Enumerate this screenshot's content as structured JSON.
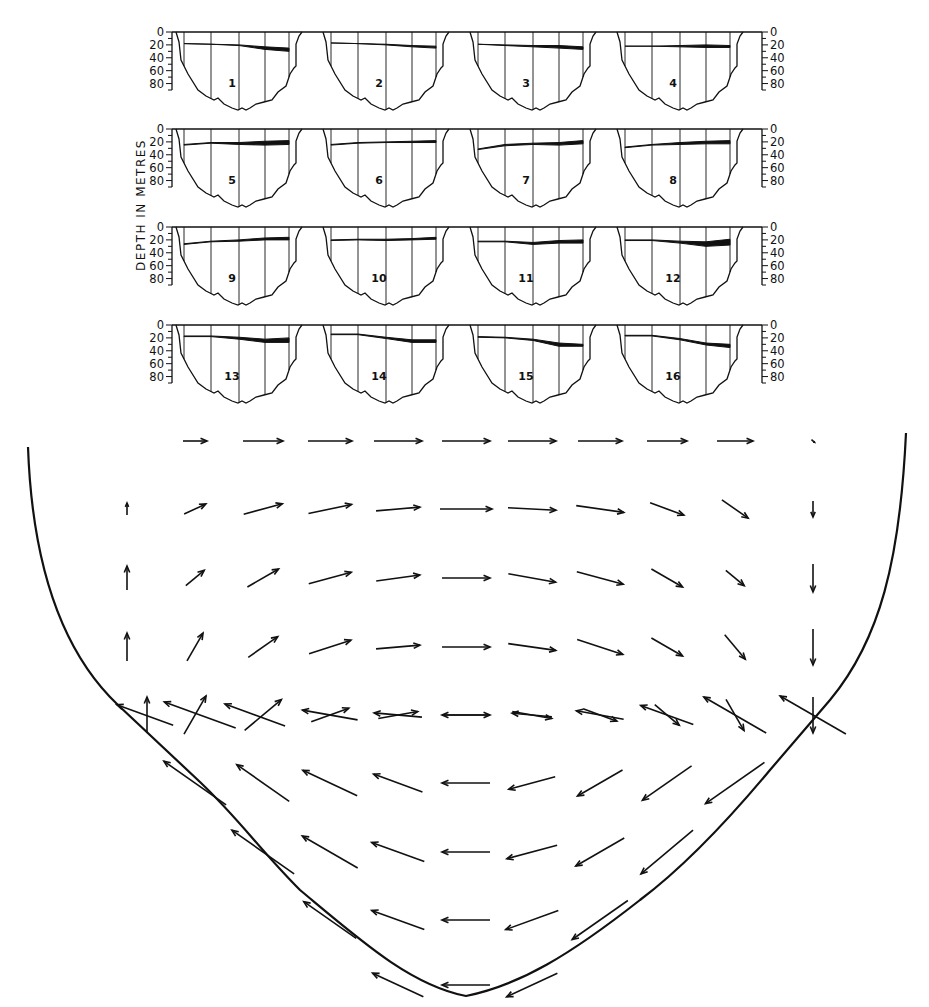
{
  "figure": {
    "upper": {
      "y_axis_label": "DEPTH IN METRES",
      "y_axis_label_words": [
        "DEPTH",
        "IN",
        "METRES"
      ],
      "depth_ticks": [
        "0",
        "20",
        "40",
        "60",
        "80"
      ],
      "panels": [
        {
          "id": "1",
          "thermocline_top": [
            18,
            19,
            20,
            23,
            25
          ],
          "thermocline_bottom": [
            18,
            19,
            21,
            27,
            30
          ]
        },
        {
          "id": "2",
          "thermocline_top": [
            17,
            18,
            19,
            21,
            22
          ],
          "thermocline_bottom": [
            17,
            18,
            20,
            23,
            25
          ]
        },
        {
          "id": "3",
          "thermocline_top": [
            19,
            20,
            21,
            21,
            23
          ],
          "thermocline_bottom": [
            19,
            21,
            23,
            25,
            27
          ]
        },
        {
          "id": "4",
          "thermocline_top": [
            22,
            22,
            21,
            20,
            21
          ],
          "thermocline_bottom": [
            22,
            22,
            23,
            24,
            24
          ]
        },
        {
          "id": "5",
          "thermocline_top": [
            24,
            21,
            21,
            19,
            18
          ],
          "thermocline_bottom": [
            25,
            22,
            24,
            25,
            24
          ]
        },
        {
          "id": "6",
          "thermocline_top": [
            24,
            21,
            20,
            19,
            18
          ],
          "thermocline_bottom": [
            25,
            22,
            21,
            21,
            21
          ]
        },
        {
          "id": "7",
          "thermocline_top": [
            31,
            24,
            22,
            21,
            18
          ],
          "thermocline_bottom": [
            32,
            26,
            24,
            25,
            23
          ]
        },
        {
          "id": "8",
          "thermocline_top": [
            28,
            24,
            21,
            19,
            18
          ],
          "thermocline_bottom": [
            29,
            25,
            24,
            23,
            23
          ]
        },
        {
          "id": "9",
          "thermocline_top": [
            26,
            22,
            20,
            17,
            16
          ],
          "thermocline_bottom": [
            27,
            23,
            22,
            20,
            20
          ]
        },
        {
          "id": "10",
          "thermocline_top": [
            20,
            19,
            19,
            18,
            16
          ],
          "thermocline_bottom": [
            21,
            20,
            21,
            20,
            19
          ]
        },
        {
          "id": "11",
          "thermocline_top": [
            22,
            22,
            24,
            21,
            20
          ],
          "thermocline_bottom": [
            23,
            23,
            27,
            25,
            25
          ]
        },
        {
          "id": "12",
          "thermocline_top": [
            20,
            20,
            22,
            23,
            19
          ],
          "thermocline_bottom": [
            21,
            21,
            25,
            30,
            28
          ]
        },
        {
          "id": "13",
          "thermocline_top": [
            17,
            17,
            19,
            22,
            20
          ],
          "thermocline_bottom": [
            18,
            18,
            22,
            27,
            27
          ]
        },
        {
          "id": "14",
          "thermocline_top": [
            14,
            14,
            19,
            23,
            23
          ],
          "thermocline_bottom": [
            15,
            15,
            21,
            27,
            27
          ]
        },
        {
          "id": "15",
          "thermocline_top": [
            18,
            19,
            22,
            28,
            30
          ],
          "thermocline_bottom": [
            19,
            20,
            24,
            33,
            33
          ]
        },
        {
          "id": "16",
          "thermocline_top": [
            16,
            16,
            21,
            28,
            30
          ],
          "thermocline_bottom": [
            17,
            17,
            23,
            31,
            35
          ]
        }
      ]
    },
    "lower": {
      "description": "Current vectors inside basin outline",
      "rows": [
        {
          "y": 441,
          "vectors": [
            [
              195,
              0.6,
              0
            ],
            [
              263,
              1.0,
              0
            ],
            [
              330,
              1.1,
              0
            ],
            [
              398,
              1.2,
              0
            ],
            [
              466,
              1.2,
              0
            ],
            [
              532,
              1.2,
              0
            ],
            [
              600,
              1.1,
              0
            ],
            [
              667,
              1.0,
              0
            ],
            [
              735,
              0.9,
              0
            ],
            [
              813,
              0.1,
              40
            ]
          ]
        },
        {
          "y": 509,
          "vectors": [
            [
              127,
              0.3,
              -90
            ],
            [
              195,
              0.6,
              -25
            ],
            [
              263,
              1.0,
              -15
            ],
            [
              330,
              1.1,
              -12
            ],
            [
              398,
              1.1,
              -5
            ],
            [
              466,
              1.3,
              0
            ],
            [
              532,
              1.2,
              3
            ],
            [
              600,
              1.2,
              8
            ],
            [
              667,
              0.9,
              20
            ],
            [
              735,
              0.8,
              35
            ],
            [
              813,
              0.4,
              90
            ]
          ]
        },
        {
          "y": 578,
          "vectors": [
            [
              127,
              0.6,
              -90
            ],
            [
              195,
              0.6,
              -40
            ],
            [
              263,
              0.9,
              -30
            ],
            [
              330,
              1.1,
              -15
            ],
            [
              398,
              1.1,
              -8
            ],
            [
              466,
              1.2,
              0
            ],
            [
              532,
              1.2,
              10
            ],
            [
              600,
              1.2,
              15
            ],
            [
              667,
              0.9,
              30
            ],
            [
              735,
              0.6,
              40
            ],
            [
              813,
              0.7,
              90
            ]
          ]
        },
        {
          "y": 647,
          "vectors": [
            [
              127,
              0.7,
              -90
            ],
            [
              195,
              0.8,
              -60
            ],
            [
              263,
              0.9,
              -35
            ],
            [
              330,
              1.1,
              -18
            ],
            [
              398,
              1.1,
              -5
            ],
            [
              466,
              1.2,
              0
            ],
            [
              532,
              1.2,
              8
            ],
            [
              600,
              1.2,
              18
            ],
            [
              667,
              0.9,
              30
            ],
            [
              735,
              0.8,
              50
            ],
            [
              813,
              0.9,
              90
            ]
          ]
        },
        {
          "y": 715,
          "vectors": [
            [
              147,
              0.9,
              -90
            ],
            [
              145,
              1.5,
              -160
            ],
            [
              195,
              1.1,
              -60
            ],
            [
              200,
              1.9,
              -160
            ],
            [
              263,
              1.2,
              -40
            ],
            [
              255,
              1.6,
              -160
            ],
            [
              330,
              1.0,
              -20
            ],
            [
              330,
              1.4,
              -170
            ],
            [
              398,
              1.0,
              -10
            ],
            [
              398,
              1.2,
              -175
            ],
            [
              466,
              1.2,
              180
            ],
            [
              466,
              1.2,
              0
            ],
            [
              532,
              1.0,
              -175
            ],
            [
              532,
              1.0,
              10
            ],
            [
              600,
              1.2,
              -170
            ],
            [
              600,
              0.9,
              20
            ],
            [
              667,
              1.4,
              -160
            ],
            [
              667,
              0.8,
              40
            ],
            [
              735,
              1.8,
              -150
            ],
            [
              735,
              0.9,
              60
            ],
            [
              813,
              1.9,
              -150
            ],
            [
              813,
              0.9,
              90
            ]
          ]
        },
        {
          "y": 783,
          "vectors": [
            [
              195,
              1.9,
              -145
            ],
            [
              263,
              1.6,
              -145
            ],
            [
              330,
              1.5,
              -155
            ],
            [
              398,
              1.3,
              -160
            ],
            [
              466,
              1.2,
              180
            ],
            [
              532,
              1.2,
              165
            ],
            [
              600,
              1.3,
              150
            ],
            [
              667,
              1.5,
              145
            ],
            [
              735,
              1.8,
              145
            ],
            [
              813,
              0,
              0
            ]
          ]
        },
        {
          "y": 852,
          "vectors": [
            [
              263,
              1.9,
              -145
            ],
            [
              330,
              1.6,
              -150
            ],
            [
              398,
              1.4,
              -160
            ],
            [
              466,
              1.2,
              180
            ],
            [
              532,
              1.3,
              165
            ],
            [
              600,
              1.4,
              150
            ],
            [
              667,
              1.7,
              140
            ]
          ]
        },
        {
          "y": 920,
          "vectors": [
            [
              330,
              1.6,
              -145
            ],
            [
              398,
              1.4,
              -160
            ],
            [
              466,
              1.2,
              180
            ],
            [
              532,
              1.4,
              160
            ],
            [
              600,
              1.7,
              145
            ]
          ]
        },
        {
          "y": 985,
          "vectors": [
            [
              398,
              1.4,
              -155
            ],
            [
              466,
              1.2,
              180
            ],
            [
              532,
              1.4,
              155
            ]
          ]
        }
      ]
    }
  }
}
